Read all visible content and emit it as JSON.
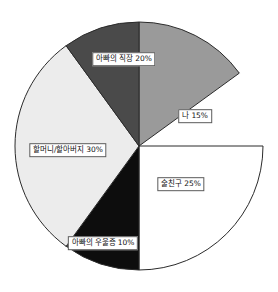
{
  "chart_data": {
    "type": "pie",
    "title": "",
    "subtitle": "",
    "xlabel": "",
    "ylabel": "",
    "legend_position": "none",
    "labels_inline": true,
    "units": "%",
    "total": 100,
    "start_angle_deg": 0,
    "direction": "clockwise",
    "center": {
      "x": 139,
      "y": 146
    },
    "radius": 124,
    "categories": [
      "나",
      "술친구",
      "아빠의 우울증",
      "할머니/할아버지",
      "아빠의 직장"
    ],
    "values": [
      15,
      25,
      10,
      30,
      20
    ],
    "slices": [
      {
        "name": "나",
        "value": 15,
        "label": "나 15%",
        "color": "#9a9a9a",
        "start_deg": 0,
        "end_deg": 54,
        "label_x": 195,
        "label_y": 116
      },
      {
        "name": "술친구",
        "value": 25,
        "label": "술친구 25%",
        "color": "#ffffff",
        "start_deg": 90,
        "end_deg": 180,
        "label_x": 181,
        "label_y": 184
      },
      {
        "name": "아빠의 우울증",
        "value": 10,
        "label": "아빠의 우울증 10%",
        "color": "#0d0d0d",
        "start_deg": 180,
        "end_deg": 216,
        "label_x": 103,
        "label_y": 243
      },
      {
        "name": "할머니/할아버지",
        "value": 30,
        "label": "할머니/할아버지 30%",
        "color": "#ececec",
        "start_deg": 216,
        "end_deg": 324,
        "label_x": 68,
        "label_y": 150
      },
      {
        "name": "아빠의 직장",
        "value": 20,
        "label": "아빠의 직장 20%",
        "color": "#4a4a4a",
        "start_deg": 324,
        "end_deg": 360,
        "label_x": 124,
        "label_y": 59
      }
    ],
    "outline_color": "#2b2b2b",
    "background_color": "#ffffff"
  }
}
